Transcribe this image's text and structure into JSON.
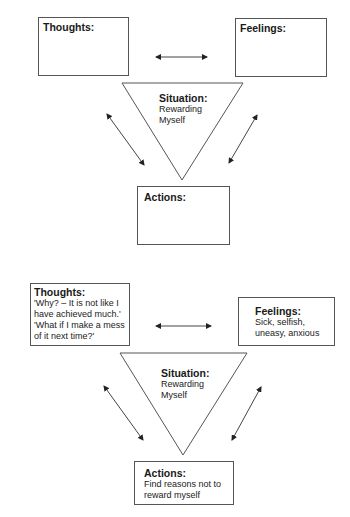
{
  "diagrams": [
    {
      "thoughts": {
        "title": "Thoughts:",
        "lines": []
      },
      "feelings": {
        "title": "Feelings:",
        "lines": []
      },
      "situation": {
        "title": "Situation:",
        "lines": [
          "Rewarding",
          "Myself"
        ]
      },
      "actions": {
        "title": "Actions:",
        "lines": []
      }
    },
    {
      "thoughts": {
        "title": "Thoughts:",
        "lines": [
          "'Why? – It is not like I",
          "have achieved much.'",
          "'What if I make a mess",
          "of it next time?'"
        ]
      },
      "feelings": {
        "title": "Feelings:",
        "lines": [
          "Sick, selfish,",
          "uneasy, anxious"
        ]
      },
      "situation": {
        "title": "Situation:",
        "lines": [
          "Rewarding",
          "Myself"
        ]
      },
      "actions": {
        "title": "Actions:",
        "lines": [
          "Find reasons not to",
          "reward myself"
        ]
      }
    }
  ],
  "colors": {
    "line": "#555555",
    "text": "#1a1a1a"
  }
}
